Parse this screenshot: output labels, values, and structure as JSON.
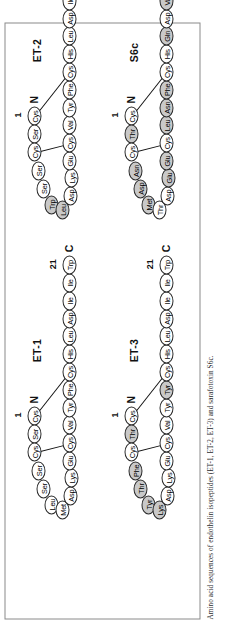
{
  "figure": {
    "caption": "Amino acid sequences of endothelin isopeptides (ET-1, ET-2, ET-3) and sarafotoxin S6c.",
    "orientation_note": "rotated",
    "terminus_n_label": "N",
    "terminus_c_label": "C",
    "position_first_label": "1",
    "position_last_label": "21",
    "colors": {
      "shaded_residue": "#c9c9c9",
      "plain_residue": "#ffffff",
      "outline": "#2a2a2a",
      "border": "#8a8a8a"
    }
  },
  "panels": [
    {
      "id": "et1",
      "name": "ET-1",
      "label": "ET-1",
      "residues": [
        {
          "pos": 1,
          "aa": "Cys",
          "shaded": false
        },
        {
          "pos": 2,
          "aa": "Ser",
          "shaded": false
        },
        {
          "pos": 3,
          "aa": "Cys",
          "shaded": false
        },
        {
          "pos": 4,
          "aa": "Ser",
          "shaded": false
        },
        {
          "pos": 5,
          "aa": "Ser",
          "shaded": false
        },
        {
          "pos": 6,
          "aa": "Leu",
          "shaded": false
        },
        {
          "pos": 7,
          "aa": "Met",
          "shaded": false
        },
        {
          "pos": 8,
          "aa": "Asp",
          "shaded": false
        },
        {
          "pos": 9,
          "aa": "Lys",
          "shaded": false
        },
        {
          "pos": 10,
          "aa": "Glu",
          "shaded": false
        },
        {
          "pos": 11,
          "aa": "Cys",
          "shaded": false
        },
        {
          "pos": 12,
          "aa": "Val",
          "shaded": false
        },
        {
          "pos": 13,
          "aa": "Tyr",
          "shaded": false
        },
        {
          "pos": 14,
          "aa": "Phe",
          "shaded": false
        },
        {
          "pos": 15,
          "aa": "Cys",
          "shaded": false
        },
        {
          "pos": 16,
          "aa": "His",
          "shaded": false
        },
        {
          "pos": 17,
          "aa": "Leu",
          "shaded": false
        },
        {
          "pos": 18,
          "aa": "Asp",
          "shaded": false
        },
        {
          "pos": 19,
          "aa": "Ile",
          "shaded": false
        },
        {
          "pos": 20,
          "aa": "Ile",
          "shaded": false
        },
        {
          "pos": 21,
          "aa": "Trp",
          "shaded": false
        }
      ],
      "disulfides": [
        [
          1,
          15
        ],
        [
          3,
          11
        ]
      ]
    },
    {
      "id": "et2",
      "name": "ET-2",
      "label": "ET-2",
      "residues": [
        {
          "pos": 1,
          "aa": "Cys",
          "shaded": false
        },
        {
          "pos": 2,
          "aa": "Ser",
          "shaded": false
        },
        {
          "pos": 3,
          "aa": "Cys",
          "shaded": false
        },
        {
          "pos": 4,
          "aa": "Ser",
          "shaded": false
        },
        {
          "pos": 5,
          "aa": "Ser",
          "shaded": false
        },
        {
          "pos": 6,
          "aa": "Trp",
          "shaded": true
        },
        {
          "pos": 7,
          "aa": "Leu",
          "shaded": true
        },
        {
          "pos": 8,
          "aa": "Asp",
          "shaded": false
        },
        {
          "pos": 9,
          "aa": "Lys",
          "shaded": false
        },
        {
          "pos": 10,
          "aa": "Glu",
          "shaded": false
        },
        {
          "pos": 11,
          "aa": "Cys",
          "shaded": false
        },
        {
          "pos": 12,
          "aa": "Val",
          "shaded": false
        },
        {
          "pos": 13,
          "aa": "Tyr",
          "shaded": false
        },
        {
          "pos": 14,
          "aa": "Phe",
          "shaded": false
        },
        {
          "pos": 15,
          "aa": "Cys",
          "shaded": false
        },
        {
          "pos": 16,
          "aa": "His",
          "shaded": false
        },
        {
          "pos": 17,
          "aa": "Leu",
          "shaded": false
        },
        {
          "pos": 18,
          "aa": "Asp",
          "shaded": false
        },
        {
          "pos": 19,
          "aa": "Ile",
          "shaded": false
        },
        {
          "pos": 20,
          "aa": "Ile",
          "shaded": false
        },
        {
          "pos": 21,
          "aa": "Trp",
          "shaded": false
        }
      ],
      "disulfides": [
        [
          1,
          15
        ],
        [
          3,
          11
        ]
      ]
    },
    {
      "id": "et3",
      "name": "ET-3",
      "label": "ET-3",
      "residues": [
        {
          "pos": 1,
          "aa": "Cys",
          "shaded": false
        },
        {
          "pos": 2,
          "aa": "Thr",
          "shaded": true
        },
        {
          "pos": 3,
          "aa": "Cys",
          "shaded": false
        },
        {
          "pos": 4,
          "aa": "Phe",
          "shaded": true
        },
        {
          "pos": 5,
          "aa": "Thr",
          "shaded": true
        },
        {
          "pos": 6,
          "aa": "Tyr",
          "shaded": true
        },
        {
          "pos": 7,
          "aa": "Lys",
          "shaded": true
        },
        {
          "pos": 8,
          "aa": "Asp",
          "shaded": false
        },
        {
          "pos": 9,
          "aa": "Lys",
          "shaded": false
        },
        {
          "pos": 10,
          "aa": "Glu",
          "shaded": false
        },
        {
          "pos": 11,
          "aa": "Cys",
          "shaded": false
        },
        {
          "pos": 12,
          "aa": "Val",
          "shaded": false
        },
        {
          "pos": 13,
          "aa": "Tyr",
          "shaded": false
        },
        {
          "pos": 14,
          "aa": "Tyr",
          "shaded": true
        },
        {
          "pos": 15,
          "aa": "Cys",
          "shaded": false
        },
        {
          "pos": 16,
          "aa": "His",
          "shaded": false
        },
        {
          "pos": 17,
          "aa": "Leu",
          "shaded": false
        },
        {
          "pos": 18,
          "aa": "Asp",
          "shaded": false
        },
        {
          "pos": 19,
          "aa": "Ile",
          "shaded": false
        },
        {
          "pos": 20,
          "aa": "Ile",
          "shaded": false
        },
        {
          "pos": 21,
          "aa": "Trp",
          "shaded": false
        }
      ],
      "disulfides": [
        [
          1,
          15
        ],
        [
          3,
          11
        ]
      ]
    },
    {
      "id": "s6c",
      "name": "S6c",
      "label": "S6c",
      "residues": [
        {
          "pos": 1,
          "aa": "Cys",
          "shaded": false
        },
        {
          "pos": 2,
          "aa": "Thr",
          "shaded": true
        },
        {
          "pos": 3,
          "aa": "Cys",
          "shaded": false
        },
        {
          "pos": 4,
          "aa": "Asn",
          "shaded": true
        },
        {
          "pos": 5,
          "aa": "Asp",
          "shaded": true
        },
        {
          "pos": 6,
          "aa": "Met",
          "shaded": true
        },
        {
          "pos": 7,
          "aa": "Thr",
          "shaded": false
        },
        {
          "pos": 8,
          "aa": "Asp",
          "shaded": false
        },
        {
          "pos": 9,
          "aa": "Glu",
          "shaded": true
        },
        {
          "pos": 10,
          "aa": "Glu",
          "shaded": true
        },
        {
          "pos": 11,
          "aa": "Cys",
          "shaded": false
        },
        {
          "pos": 12,
          "aa": "Leu",
          "shaded": true
        },
        {
          "pos": 13,
          "aa": "Asn",
          "shaded": true
        },
        {
          "pos": 14,
          "aa": "Phe",
          "shaded": true
        },
        {
          "pos": 15,
          "aa": "Cys",
          "shaded": false
        },
        {
          "pos": 16,
          "aa": "His",
          "shaded": false
        },
        {
          "pos": 17,
          "aa": "Gln",
          "shaded": true
        },
        {
          "pos": 18,
          "aa": "Asp",
          "shaded": false
        },
        {
          "pos": 19,
          "aa": "Val",
          "shaded": true
        },
        {
          "pos": 20,
          "aa": "Ile",
          "shaded": false
        },
        {
          "pos": 21,
          "aa": "Trp",
          "shaded": false
        }
      ],
      "disulfides": [
        [
          1,
          15
        ],
        [
          3,
          11
        ]
      ]
    }
  ]
}
